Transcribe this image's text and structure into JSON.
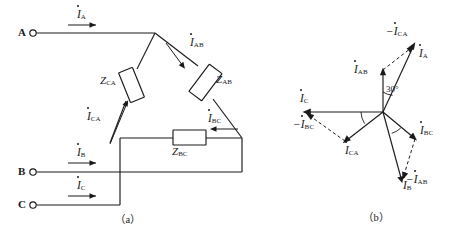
{
  "figure": {
    "width": 457,
    "height": 238,
    "background": "#ffffff",
    "ink": "#1a1a1a"
  },
  "panel_a": {
    "caption": "（a）",
    "description": "Three-phase delta (triangle) connected load with line terminals A, B, C",
    "terminals": [
      {
        "name": "A",
        "label": "A"
      },
      {
        "name": "B",
        "label": "B"
      },
      {
        "name": "C",
        "label": "C"
      }
    ],
    "line_currents": [
      {
        "name": "I-A",
        "symbol": "I",
        "subscript": "A"
      },
      {
        "name": "I-B",
        "symbol": "I",
        "subscript": "B"
      },
      {
        "name": "I-C",
        "symbol": "I",
        "subscript": "C"
      }
    ],
    "phase_currents": [
      {
        "name": "I-AB",
        "symbol": "I",
        "subscript": "AB"
      },
      {
        "name": "I-BC",
        "symbol": "I",
        "subscript": "BC"
      },
      {
        "name": "I-CA",
        "symbol": "I",
        "subscript": "CA"
      }
    ],
    "impedances": [
      {
        "name": "Z-AB",
        "symbol": "Z",
        "subscript": "AB"
      },
      {
        "name": "Z-BC",
        "symbol": "Z",
        "subscript": "BC"
      },
      {
        "name": "Z-CA",
        "symbol": "Z",
        "subscript": "CA"
      }
    ]
  },
  "panel_b": {
    "caption": "（b）",
    "description": "Phasor diagram showing line currents as differences of phase currents",
    "angle_label": "30°",
    "phasors": [
      {
        "name": "I-A",
        "symbol": "I",
        "subscript": "A",
        "style": "solid"
      },
      {
        "name": "I-B",
        "symbol": "I",
        "subscript": "B",
        "style": "solid"
      },
      {
        "name": "I-C",
        "symbol": "I",
        "subscript": "C",
        "style": "solid"
      },
      {
        "name": "I-AB",
        "symbol": "I",
        "subscript": "AB",
        "style": "solid"
      },
      {
        "name": "I-BC",
        "symbol": "I",
        "subscript": "BC",
        "style": "solid"
      },
      {
        "name": "I-CA",
        "symbol": "I",
        "subscript": "CA",
        "style": "solid"
      },
      {
        "name": "neg-I-AB",
        "prefix": "−",
        "symbol": "I",
        "subscript": "AB",
        "style": "dashed"
      },
      {
        "name": "neg-I-BC",
        "prefix": "−",
        "symbol": "I",
        "subscript": "BC",
        "style": "dashed"
      },
      {
        "name": "neg-I-CA",
        "prefix": "−",
        "symbol": "I",
        "subscript": "CA",
        "style": "dashed"
      }
    ]
  }
}
